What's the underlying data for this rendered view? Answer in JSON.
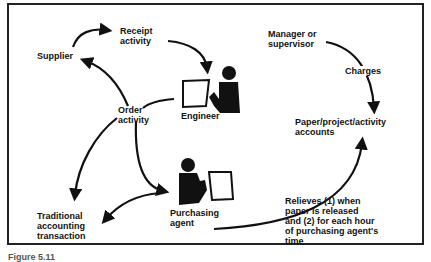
{
  "diagram": {
    "nodes": {
      "supplier": "Supplier",
      "receipt_activity": "Receipt\nactivity",
      "engineer": "Engineer",
      "order_activity": "Order\nactivity",
      "manager": "Manager or\nsupervisor",
      "charges": "Charges",
      "accounts": "Paper/project/activity\naccounts",
      "traditional": "Traditional\naccounting\ntransaction",
      "purchasing_agent": "Purchasing\nagent",
      "relieves": "Relieves (1) when\npaper is released\nand (2) for each hour\nof purchasing agent's\ntime"
    },
    "edges": [
      {
        "from": "Supplier",
        "to": "Receipt activity"
      },
      {
        "from": "Receipt activity",
        "to": "Engineer"
      },
      {
        "from": "Engineer",
        "to": "Order activity"
      },
      {
        "from": "Order activity",
        "to": "Supplier"
      },
      {
        "from": "Order activity",
        "to": "Traditional accounting transaction"
      },
      {
        "from": "Order activity",
        "to": "Purchasing agent"
      },
      {
        "from": "Purchasing agent",
        "to": "Traditional accounting transaction"
      },
      {
        "from": "Manager or supervisor",
        "to": "Paper/project/activity accounts",
        "label": "Charges"
      },
      {
        "from": "Purchasing agent",
        "to": "Paper/project/activity accounts",
        "label": "Relieves"
      }
    ],
    "icons": [
      "engineer-person-with-paper-icon",
      "purchasing-agent-person-with-paper-icon"
    ],
    "caption": "Figure 5.11"
  }
}
